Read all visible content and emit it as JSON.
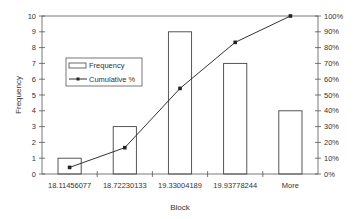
{
  "chart_data": {
    "type": "bar",
    "title": "",
    "xlabel": "Block",
    "ylabel": "Frequency",
    "y2label": "",
    "categories": [
      "18.11456077",
      "18.72230133",
      "19.33004189",
      "19.93778244",
      "More"
    ],
    "series": [
      {
        "name": "Frequency",
        "type": "bar",
        "axis": "left",
        "values": [
          1,
          3,
          9,
          7,
          4
        ]
      },
      {
        "name": "Cumulative %",
        "type": "line",
        "axis": "right",
        "values": [
          4.17,
          16.67,
          54.17,
          83.33,
          100.0
        ]
      }
    ],
    "ylim": [
      0,
      10
    ],
    "y2lim": [
      0,
      100
    ],
    "yticks": [
      "0",
      "1",
      "2",
      "3",
      "4",
      "5",
      "6",
      "7",
      "8",
      "9",
      "10"
    ],
    "y2ticks": [
      "0%",
      "10%",
      "20%",
      "30%",
      "40%",
      "50%",
      "60%",
      "70%",
      "80%",
      "90%",
      "100%"
    ],
    "legend": {
      "position": "upper-left-inside",
      "entries": [
        "Frequency",
        "Cumulative %"
      ]
    },
    "grid": false
  },
  "colors": {
    "axis": "#555555",
    "bar_fill": "#ffffff",
    "bar_stroke": "#444444",
    "line": "#333333",
    "marker": "#222222"
  }
}
